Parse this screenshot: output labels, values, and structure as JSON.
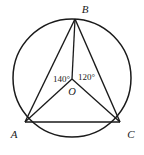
{
  "figure": {
    "type": "circle-geometry-diagram",
    "background_color": "#ffffff",
    "stroke_color": "#1a1a1a",
    "circle": {
      "label": "circle-O",
      "center_x": 72,
      "center_y": 78,
      "radius": 59
    },
    "points": [
      {
        "id": "B",
        "label": "B",
        "x": 75,
        "y": 19,
        "label_x": 82,
        "label_y": 13
      },
      {
        "id": "A",
        "label": "A",
        "x": 25,
        "y": 122,
        "label_x": 13,
        "label_y": 135
      },
      {
        "id": "C",
        "label": "C",
        "x": 120,
        "y": 122,
        "label_x": 128,
        "label_y": 135
      },
      {
        "id": "O",
        "label": "O",
        "x": 72,
        "y": 79,
        "label_x": 68,
        "label_y": 95
      }
    ],
    "segments": [
      {
        "name": "chord-AB",
        "from": "A",
        "to": "B"
      },
      {
        "name": "chord-BC",
        "from": "B",
        "to": "C"
      },
      {
        "name": "chord-AC",
        "from": "A",
        "to": "C"
      },
      {
        "name": "radius-OA",
        "from": "O",
        "to": "A"
      },
      {
        "name": "radius-OB",
        "from": "O",
        "to": "B"
      },
      {
        "name": "radius-OC",
        "from": "O",
        "to": "C"
      }
    ],
    "angles": [
      {
        "name": "angle-AOB",
        "value": "140",
        "unit": "°",
        "text": "140°",
        "label_x": 46,
        "label_y": 82
      },
      {
        "name": "angle-BOC",
        "value": "120",
        "unit": "°",
        "text": "120°",
        "label_x": 78,
        "label_y": 80
      }
    ]
  }
}
